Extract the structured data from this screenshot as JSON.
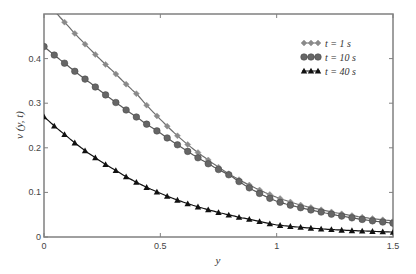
{
  "chart_data": {
    "type": "line",
    "title": "",
    "xlabel": "y",
    "ylabel": "v (y, t)",
    "xlim": [
      0,
      1.5
    ],
    "ylim": [
      0,
      0.5
    ],
    "x_ticks": [
      0,
      0.5,
      1,
      1.5
    ],
    "x_tick_labels": [
      "0",
      "0.5",
      "1",
      "1.5"
    ],
    "y_ticks": [
      0,
      0.1,
      0.2,
      0.3,
      0.4
    ],
    "y_tick_labels": [
      "0",
      "0.1",
      "0.2",
      "0.3",
      "0.4"
    ],
    "grid": false,
    "legend_position": "upper right",
    "x": [
      0,
      0.1,
      0.2,
      0.3,
      0.4,
      0.5,
      0.6,
      0.7,
      0.8,
      0.9,
      1.0,
      1.1,
      1.2,
      1.3,
      1.4,
      1.5
    ],
    "series": [
      {
        "name": "t = 1 s",
        "marker": "diamond",
        "color": "#6e6e6e",
        "values": [
          0.535,
          0.475,
          0.42,
          0.37,
          0.32,
          0.264,
          0.215,
          0.175,
          0.14,
          0.112,
          0.089,
          0.072,
          0.06,
          0.05,
          0.042,
          0.036
        ]
      },
      {
        "name": "t = 10 s",
        "marker": "circle",
        "color": "#5a5a5a",
        "values": [
          0.427,
          0.385,
          0.345,
          0.305,
          0.268,
          0.233,
          0.198,
          0.166,
          0.138,
          0.105,
          0.08,
          0.066,
          0.055,
          0.045,
          0.037,
          0.031
        ]
      },
      {
        "name": "t = 40 s",
        "marker": "triangle",
        "color": "#111111",
        "values": [
          0.27,
          0.225,
          0.185,
          0.152,
          0.122,
          0.098,
          0.078,
          0.062,
          0.049,
          0.038,
          0.027,
          0.022,
          0.018,
          0.015,
          0.013,
          0.011
        ]
      }
    ]
  }
}
